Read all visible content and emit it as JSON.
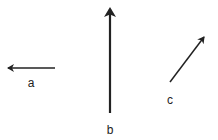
{
  "diagram": {
    "title": "",
    "stroke_color": "#222222",
    "background": "#ffffff",
    "vectors": [
      {
        "id": "a",
        "label": "a",
        "direction": "left",
        "x1": 55,
        "y1": 68,
        "x2": 7,
        "y2": 68,
        "stroke_width": 1.5,
        "label_x": 31,
        "label_y": 87
      },
      {
        "id": "b",
        "label": "b",
        "direction": "up",
        "x1": 110,
        "y1": 113,
        "x2": 110,
        "y2": 8,
        "stroke_width": 2.2,
        "label_x": 110,
        "label_y": 134
      },
      {
        "id": "c",
        "label": "c",
        "direction": "up-right",
        "x1": 170,
        "y1": 82,
        "x2": 204,
        "y2": 37,
        "stroke_width": 1.5,
        "label_x": 170,
        "label_y": 104
      }
    ]
  }
}
